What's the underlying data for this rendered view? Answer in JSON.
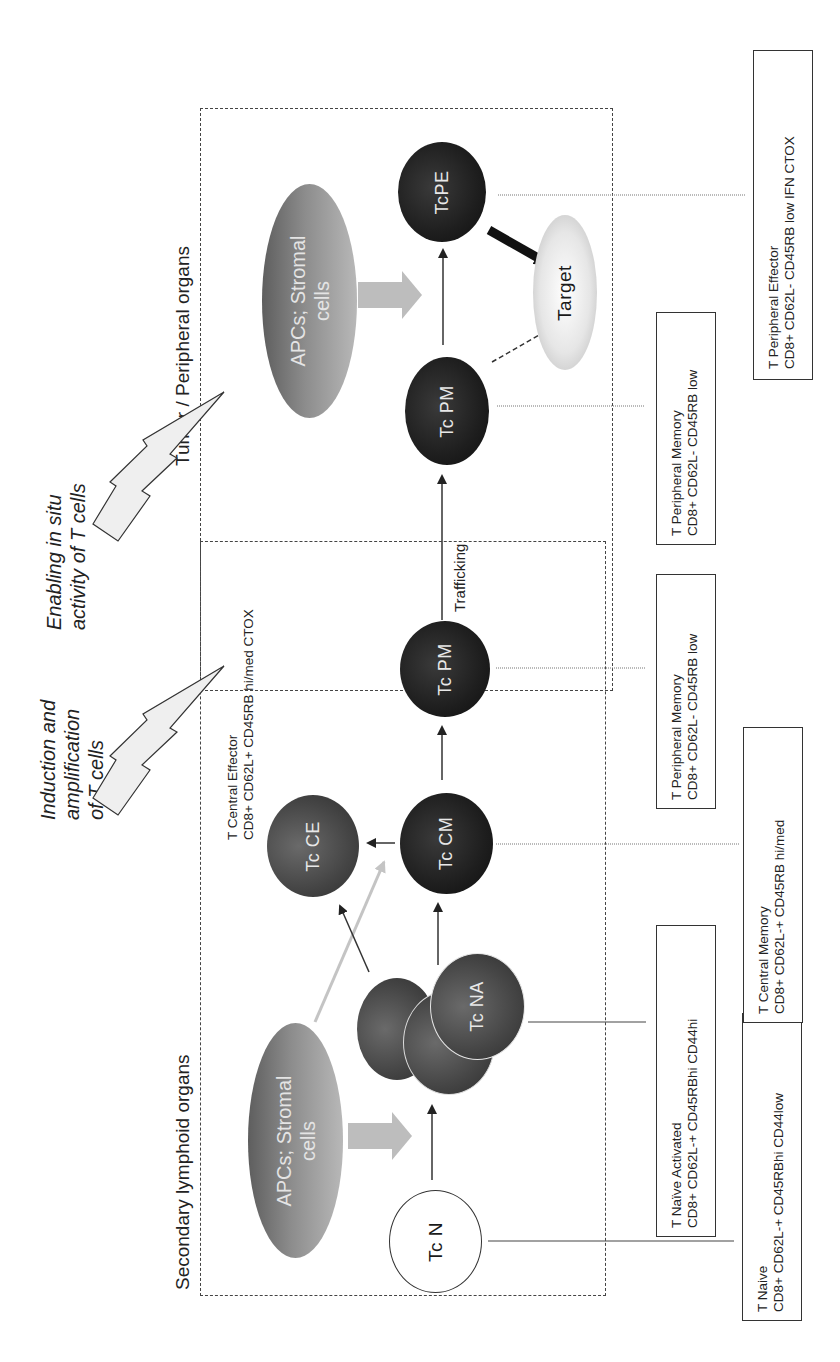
{
  "diagram": {
    "regions": {
      "secondary_lymphoid": "Secondary lymphoid organs",
      "tumor_peripheral": "Tumor / Peripheral organs"
    },
    "phase_labels": {
      "induction": [
        "Induction and",
        "amplification",
        "of T cells"
      ],
      "enabling": [
        "Enabling in situ",
        "activity of T cells"
      ]
    },
    "cells": {
      "apc_lower": [
        "APCs; Stromal",
        "cells"
      ],
      "apc_upper": [
        "APCs; Stromal",
        "cells"
      ],
      "tc_n": "Tc N",
      "tc_na": "Tc NA",
      "tc_ce": "Tc CE",
      "tc_cm": "Tc CM",
      "tc_pm_lower": "Tc PM",
      "tc_pm_upper": "Tc PM",
      "tc_pe": "TcPE",
      "target": "Target"
    },
    "edge_labels": {
      "trafficking": "Trafficking"
    },
    "phenotypes": {
      "naive": {
        "title": "T Naive",
        "markers": "CD8+ CD62L-+ CD45RBhi  CD44low"
      },
      "naive_activated": {
        "title": "T Naïve Activated",
        "markers": "CD8+ CD62L-+ CD45RBhi  CD44hi"
      },
      "central_memory": {
        "title": "T Central Memory",
        "markers": "CD8+ CD62L-+ CD45RB  hi/med"
      },
      "central_effector": {
        "title": "T Central Effector",
        "markers": "CD8+ CD62L+  CD45RB hi/med  CTOX"
      },
      "peripheral_memory_lower": {
        "title": "T Peripheral Memory",
        "markers": "CD8+ CD62L-  CD45RB low"
      },
      "peripheral_memory_upper": {
        "title": "T Peripheral Memory",
        "markers": "CD8+ CD62L-  CD45RB low"
      },
      "peripheral_effector": {
        "title": "T Peripheral Effector",
        "markers": "CD8+ CD62L-  CD45RB low  IFN CTOX"
      }
    },
    "colors": {
      "dark_cell": "#1e1e1e",
      "mid_cell": "#454545",
      "apc": "#8c8c8c",
      "stimulus_arrow": "#b4b4b4",
      "lightning_fill": "#efefef",
      "line": "#333333"
    }
  }
}
